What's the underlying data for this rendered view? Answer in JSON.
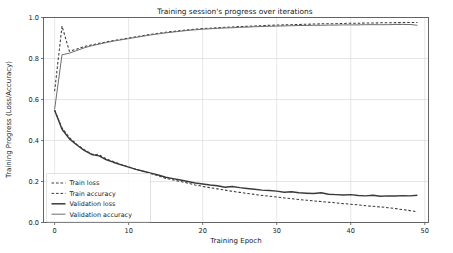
{
  "chart_data": {
    "type": "line",
    "title": "Training session's progress over iterations",
    "xlabel": "Training Epoch",
    "ylabel": "Training Progress (Loss/Accuracy)",
    "xlim": [
      -1.5,
      50.5
    ],
    "ylim": [
      0.0,
      1.0
    ],
    "xticks": [
      0,
      10,
      20,
      30,
      40,
      50
    ],
    "xticklabels": [
      "0",
      "10",
      "20",
      "30",
      "40",
      "50"
    ],
    "yticks": [
      0.0,
      0.2,
      0.4,
      0.6,
      0.8,
      1.0
    ],
    "yticklabels": [
      "0.0",
      "0.2",
      "0.4",
      "0.6",
      "0.8",
      "1.0"
    ],
    "grid": true,
    "legend_position": "lower left",
    "x": [
      0,
      1,
      2,
      3,
      4,
      5,
      6,
      7,
      8,
      9,
      10,
      11,
      12,
      13,
      14,
      15,
      16,
      17,
      18,
      19,
      20,
      21,
      22,
      23,
      24,
      25,
      26,
      27,
      28,
      29,
      30,
      31,
      32,
      33,
      34,
      35,
      36,
      37,
      38,
      39,
      40,
      41,
      42,
      43,
      44,
      45,
      46,
      47,
      48,
      49
    ],
    "series": [
      {
        "name": "Train loss",
        "style": "dashed",
        "color": "#3a3a3a",
        "values": [
          0.548,
          0.462,
          0.414,
          0.381,
          0.355,
          0.334,
          0.33,
          0.31,
          0.296,
          0.283,
          0.271,
          0.259,
          0.249,
          0.238,
          0.228,
          0.215,
          0.208,
          0.2,
          0.192,
          0.183,
          0.176,
          0.17,
          0.164,
          0.158,
          0.152,
          0.147,
          0.142,
          0.137,
          0.132,
          0.128,
          0.124,
          0.12,
          0.116,
          0.112,
          0.109,
          0.105,
          0.102,
          0.099,
          0.096,
          0.092,
          0.089,
          0.086,
          0.082,
          0.079,
          0.076,
          0.072,
          0.068,
          0.063,
          0.058,
          0.052
        ]
      },
      {
        "name": "Train accuracy",
        "style": "dashed",
        "color": "#3a3a3a",
        "values": [
          0.64,
          0.958,
          0.835,
          0.846,
          0.858,
          0.867,
          0.874,
          0.881,
          0.888,
          0.894,
          0.9,
          0.906,
          0.912,
          0.918,
          0.923,
          0.928,
          0.932,
          0.936,
          0.94,
          0.943,
          0.946,
          0.948,
          0.95,
          0.952,
          0.954,
          0.956,
          0.957,
          0.959,
          0.96,
          0.962,
          0.963,
          0.964,
          0.965,
          0.966,
          0.967,
          0.968,
          0.969,
          0.97,
          0.97,
          0.971,
          0.972,
          0.972,
          0.973,
          0.973,
          0.974,
          0.974,
          0.975,
          0.975,
          0.976,
          0.976
        ]
      },
      {
        "name": "Validation loss",
        "style": "solid",
        "color": "#3a3a3a",
        "values": [
          0.548,
          0.455,
          0.408,
          0.378,
          0.352,
          0.332,
          0.325,
          0.306,
          0.293,
          0.281,
          0.27,
          0.259,
          0.25,
          0.241,
          0.232,
          0.221,
          0.214,
          0.207,
          0.2,
          0.193,
          0.188,
          0.183,
          0.179,
          0.172,
          0.176,
          0.17,
          0.166,
          0.162,
          0.158,
          0.156,
          0.153,
          0.148,
          0.15,
          0.145,
          0.143,
          0.141,
          0.145,
          0.138,
          0.136,
          0.134,
          0.136,
          0.132,
          0.13,
          0.133,
          0.128,
          0.13,
          0.129,
          0.131,
          0.13,
          0.133
        ]
      },
      {
        "name": "Validation accuracy",
        "style": "solid",
        "color": "#6e6e6e",
        "values": [
          0.552,
          0.818,
          0.826,
          0.839,
          0.852,
          0.862,
          0.87,
          0.878,
          0.885,
          0.891,
          0.897,
          0.903,
          0.909,
          0.915,
          0.92,
          0.925,
          0.929,
          0.933,
          0.937,
          0.94,
          0.943,
          0.945,
          0.947,
          0.949,
          0.95,
          0.952,
          0.953,
          0.955,
          0.956,
          0.957,
          0.958,
          0.959,
          0.96,
          0.961,
          0.961,
          0.962,
          0.962,
          0.963,
          0.963,
          0.964,
          0.964,
          0.964,
          0.965,
          0.965,
          0.965,
          0.965,
          0.966,
          0.966,
          0.966,
          0.962
        ]
      }
    ],
    "legend_entries": [
      {
        "label": "Train loss",
        "style": "dashed",
        "color": "#3a3a3a",
        "width": 1.0
      },
      {
        "label": "Train accuracy",
        "style": "dashed",
        "color": "#3a3a3a",
        "width": 1.0
      },
      {
        "label": "Validation loss",
        "style": "solid",
        "color": "#3a3a3a",
        "width": 1.5
      },
      {
        "label": "Validation accuracy",
        "style": "solid",
        "color": "#6e6e6e",
        "width": 1.0
      }
    ]
  }
}
